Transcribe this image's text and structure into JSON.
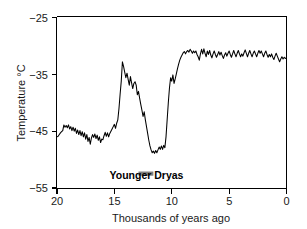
{
  "chart_data": {
    "type": "line",
    "title": "",
    "subtitle": "",
    "xlabel": "Thousands of years ago",
    "ylabel": "Temperature °C",
    "xlim": [
      20,
      0
    ],
    "ylim": [
      -55,
      -25
    ],
    "x_ticks": [
      20,
      15,
      10,
      5,
      0
    ],
    "x_tick_labels": [
      "20",
      "15",
      "10",
      "5",
      "0"
    ],
    "y_ticks": [
      -25,
      -35,
      -45,
      -55
    ],
    "y_tick_labels": [
      "−25",
      "−35",
      "−45",
      "−55"
    ],
    "grid": false,
    "legend": null,
    "x_axis_direction": "reversed",
    "line_color": "#000000",
    "annotations": [
      {
        "name": "younger-dryas",
        "label": "Younger Dryas",
        "bar_color": "#808080",
        "x_start": 12.9,
        "x_end": 11.6,
        "label_x": 12.2,
        "bar_y": -52.1,
        "label_y": -53.4
      }
    ],
    "series": [
      {
        "name": "Greenland ice-core temperature",
        "x": [
          20.0,
          19.9,
          19.8,
          19.7,
          19.6,
          19.5,
          19.4,
          19.3,
          19.2,
          19.1,
          19.0,
          18.9,
          18.8,
          18.7,
          18.6,
          18.5,
          18.4,
          18.3,
          18.2,
          18.1,
          18.0,
          17.9,
          17.8,
          17.7,
          17.6,
          17.5,
          17.4,
          17.3,
          17.2,
          17.1,
          17.0,
          16.9,
          16.8,
          16.7,
          16.6,
          16.5,
          16.4,
          16.3,
          16.2,
          16.1,
          16.0,
          15.9,
          15.8,
          15.7,
          15.6,
          15.5,
          15.4,
          15.3,
          15.2,
          15.1,
          15.0,
          14.9,
          14.8,
          14.7,
          14.6,
          14.5,
          14.4,
          14.3,
          14.2,
          14.1,
          14.0,
          13.9,
          13.8,
          13.7,
          13.6,
          13.5,
          13.4,
          13.3,
          13.2,
          13.1,
          13.0,
          12.9,
          12.8,
          12.7,
          12.6,
          12.5,
          12.4,
          12.3,
          12.2,
          12.1,
          12.0,
          11.9,
          11.8,
          11.7,
          11.6,
          11.5,
          11.4,
          11.3,
          11.2,
          11.1,
          11.0,
          10.9,
          10.8,
          10.7,
          10.6,
          10.5,
          10.4,
          10.3,
          10.2,
          10.1,
          10.0,
          9.9,
          9.8,
          9.7,
          9.6,
          9.5,
          9.4,
          9.3,
          9.2,
          9.1,
          9.0,
          8.9,
          8.8,
          8.7,
          8.6,
          8.5,
          8.4,
          8.3,
          8.2,
          8.1,
          8.0,
          7.9,
          7.8,
          7.7,
          7.6,
          7.5,
          7.4,
          7.3,
          7.2,
          7.1,
          7.0,
          6.9,
          6.8,
          6.7,
          6.6,
          6.5,
          6.4,
          6.3,
          6.2,
          6.1,
          6.0,
          5.9,
          5.8,
          5.7,
          5.6,
          5.5,
          5.4,
          5.3,
          5.2,
          5.1,
          5.0,
          4.9,
          4.8,
          4.7,
          4.6,
          4.5,
          4.4,
          4.3,
          4.2,
          4.1,
          4.0,
          3.9,
          3.8,
          3.7,
          3.6,
          3.5,
          3.4,
          3.3,
          3.2,
          3.1,
          3.0,
          2.9,
          2.8,
          2.7,
          2.6,
          2.5,
          2.4,
          2.3,
          2.2,
          2.1,
          2.0,
          1.9,
          1.8,
          1.7,
          1.6,
          1.5,
          1.4,
          1.3,
          1.2,
          1.1,
          1.0,
          0.9,
          0.8,
          0.7,
          0.6,
          0.5,
          0.4,
          0.3,
          0.2,
          0.1,
          0.0
        ],
        "y": [
          -46.0,
          -45.9,
          -45.6,
          -45.3,
          -45.1,
          -44.9,
          -43.9,
          -44.3,
          -44.0,
          -44.4,
          -43.9,
          -44.6,
          -44.2,
          -44.9,
          -44.3,
          -45.0,
          -44.5,
          -45.4,
          -44.8,
          -45.6,
          -44.9,
          -45.8,
          -45.1,
          -46.0,
          -45.3,
          -46.4,
          -45.6,
          -46.8,
          -46.1,
          -47.3,
          -46.2,
          -45.6,
          -46.1,
          -45.5,
          -46.3,
          -45.7,
          -46.6,
          -46.0,
          -47.0,
          -46.4,
          -46.5,
          -45.8,
          -45.2,
          -45.9,
          -45.3,
          -46.0,
          -45.4,
          -45.0,
          -44.6,
          -44.2,
          -43.8,
          -44.5,
          -43.6,
          -43.0,
          -41.0,
          -38.5,
          -36.2,
          -32.8,
          -33.6,
          -34.6,
          -35.6,
          -34.8,
          -35.9,
          -36.9,
          -35.4,
          -36.5,
          -37.5,
          -36.6,
          -36.3,
          -36.9,
          -38.6,
          -38.0,
          -39.2,
          -40.3,
          -41.3,
          -42.4,
          -41.6,
          -43.0,
          -44.2,
          -45.4,
          -46.6,
          -47.6,
          -48.3,
          -48.8,
          -48.5,
          -48.9,
          -48.4,
          -48.8,
          -48.3,
          -47.8,
          -48.2,
          -47.6,
          -48.2,
          -47.5,
          -47.9,
          -46.0,
          -43.0,
          -40.0,
          -37.4,
          -35.6,
          -36.2,
          -35.1,
          -36.6,
          -35.8,
          -34.9,
          -34.0,
          -33.2,
          -32.5,
          -32.0,
          -31.6,
          -31.2,
          -31.0,
          -31.4,
          -31.0,
          -30.8,
          -31.1,
          -30.6,
          -30.9,
          -31.3,
          -30.9,
          -31.2,
          -30.9,
          -31.5,
          -31.9,
          -32.5,
          -31.4,
          -30.6,
          -31.4,
          -30.5,
          -31.3,
          -31.9,
          -30.9,
          -31.5,
          -30.8,
          -31.6,
          -32.1,
          -31.4,
          -30.9,
          -31.5,
          -32.0,
          -31.5,
          -31.0,
          -31.6,
          -31.1,
          -31.7,
          -32.2,
          -31.6,
          -31.2,
          -31.8,
          -31.3,
          -30.9,
          -31.5,
          -32.0,
          -31.4,
          -30.8,
          -31.4,
          -31.9,
          -31.3,
          -30.8,
          -31.4,
          -31.9,
          -31.4,
          -31.8,
          -31.2,
          -30.7,
          -31.3,
          -31.9,
          -31.3,
          -30.8,
          -31.4,
          -31.9,
          -31.3,
          -30.9,
          -31.4,
          -31.9,
          -31.3,
          -30.8,
          -31.3,
          -30.9,
          -31.4,
          -31.9,
          -31.3,
          -30.9,
          -31.5,
          -32.0,
          -31.5,
          -31.9,
          -31.4,
          -32.0,
          -32.4,
          -31.8,
          -31.3,
          -31.8,
          -32.3,
          -32.8,
          -32.3,
          -31.9,
          -32.3,
          -32.0,
          -32.2,
          -32.1
        ]
      }
    ]
  },
  "axis_labels": {
    "y_title": "Temperature °C",
    "x_title": "Thousands of years ago"
  }
}
